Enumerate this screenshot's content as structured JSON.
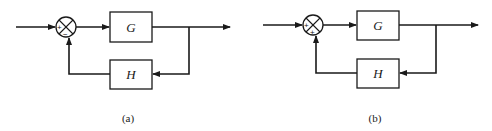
{
  "diagrams": [
    {
      "caption": "(a)",
      "forward_block": "G",
      "feedback_block": "H",
      "junction_signs": {
        "input": "+",
        "feedback": "−"
      },
      "feedback_type": "negative"
    },
    {
      "caption": "(b)",
      "forward_block": "G",
      "feedback_block": "H",
      "junction_signs": {
        "input": "+",
        "feedback": "+"
      },
      "feedback_type": "positive"
    }
  ],
  "colors": {
    "stroke": "#1a1a1a",
    "background": "#ffffff"
  }
}
